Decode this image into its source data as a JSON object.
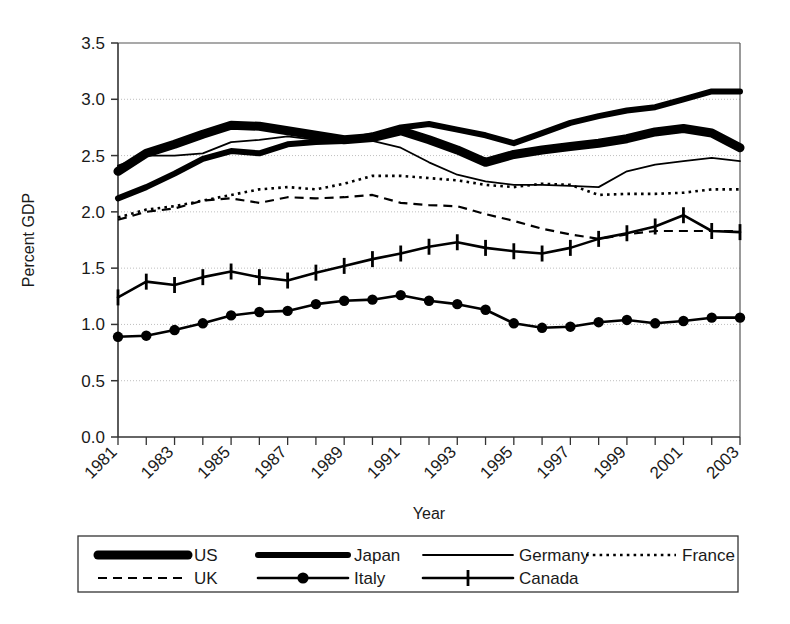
{
  "chart_data": {
    "type": "line",
    "title": "",
    "xlabel": "Year",
    "ylabel": "Percent GDP",
    "xlim": [
      1981,
      2003
    ],
    "ylim": [
      0.0,
      3.5
    ],
    "grid": true,
    "legend_position": "bottom",
    "x": [
      1981,
      1982,
      1983,
      1984,
      1985,
      1986,
      1987,
      1988,
      1989,
      1990,
      1991,
      1992,
      1993,
      1994,
      1995,
      1996,
      1997,
      1998,
      1999,
      2000,
      2001,
      2002,
      2003
    ],
    "y_ticks": [
      "0.0",
      "0.5",
      "1.0",
      "1.5",
      "2.0",
      "2.5",
      "3.0",
      "3.5"
    ],
    "x_tick_labels": [
      "1981",
      "1983",
      "1985",
      "1987",
      "1989",
      "1991",
      "1993",
      "1995",
      "1997",
      "1999",
      "2001",
      "2003"
    ],
    "series": [
      {
        "name": "US",
        "style": "very-thick-solid",
        "color": "#000000",
        "values": [
          2.36,
          2.52,
          2.6,
          2.69,
          2.77,
          2.76,
          2.72,
          2.68,
          2.64,
          2.66,
          2.72,
          2.64,
          2.55,
          2.44,
          2.51,
          2.55,
          2.58,
          2.61,
          2.65,
          2.71,
          2.74,
          2.7,
          2.57
        ]
      },
      {
        "name": "Japan",
        "style": "thick-solid",
        "color": "#000000",
        "values": [
          2.12,
          2.22,
          2.34,
          2.47,
          2.54,
          2.52,
          2.6,
          2.62,
          2.63,
          2.68,
          2.75,
          2.78,
          2.73,
          2.68,
          2.61,
          2.7,
          2.79,
          2.85,
          2.9,
          2.93,
          3.0,
          3.07,
          3.07
        ]
      },
      {
        "name": "Germany",
        "style": "thin-solid",
        "color": "#000000",
        "values": [
          2.41,
          2.5,
          2.5,
          2.52,
          2.62,
          2.64,
          2.67,
          2.64,
          2.63,
          2.63,
          2.57,
          2.44,
          2.33,
          2.27,
          2.24,
          2.24,
          2.23,
          2.22,
          2.36,
          2.42,
          2.45,
          2.48,
          2.45
        ]
      },
      {
        "name": "France",
        "style": "dotted",
        "color": "#000000",
        "values": [
          1.95,
          2.02,
          2.05,
          2.1,
          2.15,
          2.2,
          2.22,
          2.2,
          2.25,
          2.32,
          2.32,
          2.3,
          2.28,
          2.24,
          2.22,
          2.25,
          2.24,
          2.15,
          2.16,
          2.16,
          2.17,
          2.2,
          2.2
        ]
      },
      {
        "name": "UK",
        "style": "dashed",
        "color": "#000000",
        "values": [
          1.93,
          2.0,
          2.03,
          2.1,
          2.12,
          2.08,
          2.13,
          2.12,
          2.13,
          2.15,
          2.08,
          2.06,
          2.05,
          1.98,
          1.92,
          1.85,
          1.8,
          1.76,
          1.8,
          1.83,
          1.83,
          1.83,
          1.83
        ]
      },
      {
        "name": "Italy",
        "style": "solid-circle",
        "color": "#000000",
        "values": [
          0.89,
          0.9,
          0.95,
          1.01,
          1.08,
          1.11,
          1.12,
          1.18,
          1.21,
          1.22,
          1.26,
          1.21,
          1.18,
          1.13,
          1.01,
          0.97,
          0.98,
          1.02,
          1.04,
          1.01,
          1.03,
          1.06,
          1.06
        ]
      },
      {
        "name": "Canada",
        "style": "solid-plus",
        "color": "#000000",
        "values": [
          1.24,
          1.38,
          1.35,
          1.42,
          1.47,
          1.42,
          1.39,
          1.46,
          1.52,
          1.58,
          1.63,
          1.69,
          1.73,
          1.68,
          1.65,
          1.63,
          1.68,
          1.76,
          1.81,
          1.87,
          1.97,
          1.83,
          1.82
        ]
      }
    ]
  },
  "legend": {
    "items": [
      {
        "label": "US",
        "style": "very-thick-solid"
      },
      {
        "label": "Japan",
        "style": "thick-solid"
      },
      {
        "label": "Germany",
        "style": "thin-solid"
      },
      {
        "label": "France",
        "style": "dotted"
      },
      {
        "label": "UK",
        "style": "dashed"
      },
      {
        "label": "Italy",
        "style": "solid-circle"
      },
      {
        "label": "Canada",
        "style": "solid-plus"
      }
    ]
  },
  "axes": {
    "y_title": "Percent GDP",
    "x_title": "Year"
  }
}
